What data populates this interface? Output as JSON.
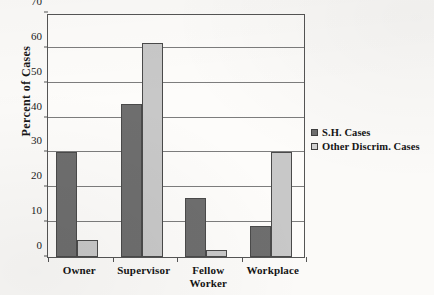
{
  "chart_data": {
    "type": "bar",
    "title": "",
    "xlabel": "",
    "ylabel": "Percent of Cases",
    "ylim": [
      0,
      70
    ],
    "yticks": [
      0,
      10,
      20,
      30,
      40,
      50,
      60,
      70
    ],
    "ytick_labels": [
      "0",
      "10",
      "20",
      "30",
      "40",
      "50",
      "60",
      "70"
    ],
    "grid": true,
    "legend_position": "right",
    "categories": [
      "Owner",
      "Supervisor",
      "Fellow Worker",
      "Workplace"
    ],
    "category_label_lines": [
      [
        "Owner"
      ],
      [
        "Supervisor"
      ],
      [
        "Fellow",
        "Worker"
      ],
      [
        "Workplace"
      ]
    ],
    "series": [
      {
        "name": "S.H. Cases",
        "color": "#6e6e6e",
        "values": [
          30,
          44,
          17,
          9
        ]
      },
      {
        "name": "Other Discrim. Cases",
        "color": "#c8c8c8",
        "values": [
          5,
          61.5,
          2,
          30
        ]
      }
    ]
  },
  "axis": {
    "y_title": "Percent of Cases"
  },
  "legend": {
    "entries": [
      {
        "label": "S.H. Cases",
        "swatch": "dark-gray-swatch-icon"
      },
      {
        "label": "Other Discrim. Cases",
        "swatch": "light-gray-swatch-icon"
      }
    ]
  }
}
